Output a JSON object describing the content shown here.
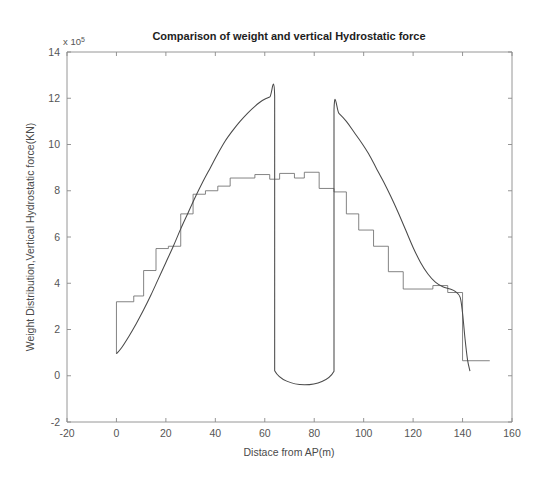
{
  "figure": {
    "title": "Comparison of weight and vertical Hydrostatic force",
    "exponent_prefix": "x 10",
    "exponent_power": "5"
  },
  "axes": {
    "xlabel": "Distace from AP(m)",
    "ylabel": "Weight Distribution,Vertical Hydrostatic force(KN)",
    "xticks": [
      "-20",
      "0",
      "20",
      "40",
      "60",
      "80",
      "100",
      "120",
      "140",
      "160"
    ],
    "yticks": [
      "-2",
      "0",
      "2",
      "4",
      "6",
      "8",
      "10",
      "12",
      "14"
    ]
  },
  "chart_data": {
    "type": "line",
    "title": "Comparison of weight and vertical Hydrostatic force",
    "xlabel": "Distace from AP(m)",
    "ylabel": "Weight Distribution,Vertical Hydrostatic force(KN)",
    "y_scale_exponent": 5,
    "y_scale_note": "values are in units of 1e5 KN",
    "xlim": [
      -20,
      160
    ],
    "ylim": [
      -2,
      14
    ],
    "xtick_step": 20,
    "ytick_step": 2,
    "grid": false,
    "legend": null,
    "series": [
      {
        "name": "Weight Distribution",
        "style": "stepped",
        "points": [
          [
            0,
            0.95
          ],
          [
            0,
            3.2
          ],
          [
            7,
            3.2
          ],
          [
            7,
            3.45
          ],
          [
            11,
            3.45
          ],
          [
            11,
            4.55
          ],
          [
            16,
            4.55
          ],
          [
            16,
            5.5
          ],
          [
            21,
            5.5
          ],
          [
            21,
            5.6
          ],
          [
            26,
            5.6
          ],
          [
            26,
            7.0
          ],
          [
            31,
            7.0
          ],
          [
            31,
            7.85
          ],
          [
            36,
            7.85
          ],
          [
            36,
            8.0
          ],
          [
            41,
            8.0
          ],
          [
            41,
            8.2
          ],
          [
            46,
            8.2
          ],
          [
            46,
            8.55
          ],
          [
            56,
            8.55
          ],
          [
            56,
            8.7
          ],
          [
            62,
            8.7
          ],
          [
            62,
            8.5
          ],
          [
            66,
            8.5
          ],
          [
            66,
            8.75
          ],
          [
            72,
            8.75
          ],
          [
            72,
            8.55
          ],
          [
            76,
            8.55
          ],
          [
            76,
            8.8
          ],
          [
            82,
            8.8
          ],
          [
            82,
            8.1
          ],
          [
            88,
            8.1
          ],
          [
            88,
            7.95
          ],
          [
            93,
            7.95
          ],
          [
            93,
            7.0
          ],
          [
            98,
            7.0
          ],
          [
            98,
            6.3
          ],
          [
            104,
            6.3
          ],
          [
            104,
            5.6
          ],
          [
            110,
            5.6
          ],
          [
            110,
            4.5
          ],
          [
            116,
            4.5
          ],
          [
            116,
            3.75
          ],
          [
            128,
            3.75
          ],
          [
            128,
            3.9
          ],
          [
            134,
            3.9
          ],
          [
            134,
            3.6
          ],
          [
            140,
            3.6
          ],
          [
            140,
            0.65
          ],
          [
            151,
            0.65
          ]
        ]
      },
      {
        "name": "Vertical Hydrostatic force",
        "style": "smooth",
        "points": [
          [
            0,
            0.95
          ],
          [
            2,
            1.2
          ],
          [
            5,
            1.7
          ],
          [
            8,
            2.25
          ],
          [
            11,
            2.85
          ],
          [
            14,
            3.5
          ],
          [
            17,
            4.2
          ],
          [
            20,
            4.9
          ],
          [
            23,
            5.6
          ],
          [
            26,
            6.35
          ],
          [
            29,
            7.05
          ],
          [
            32,
            7.75
          ],
          [
            35,
            8.4
          ],
          [
            38,
            9.0
          ],
          [
            41,
            9.6
          ],
          [
            44,
            10.15
          ],
          [
            47,
            10.6
          ],
          [
            50,
            11.0
          ],
          [
            53,
            11.35
          ],
          [
            56,
            11.65
          ],
          [
            59,
            11.9
          ],
          [
            62,
            12.05
          ],
          [
            64,
            12.1
          ],
          [
            64,
            5.0
          ],
          [
            64,
            0.22
          ],
          [
            88,
            0.2
          ],
          [
            88,
            5.0
          ],
          [
            88,
            11.5
          ],
          [
            90,
            11.35
          ],
          [
            93,
            11.0
          ],
          [
            96,
            10.55
          ],
          [
            99,
            10.1
          ],
          [
            102,
            9.6
          ],
          [
            105,
            9.0
          ],
          [
            108,
            8.4
          ],
          [
            111,
            7.75
          ],
          [
            114,
            7.05
          ],
          [
            117,
            6.3
          ],
          [
            120,
            5.55
          ],
          [
            123,
            4.9
          ],
          [
            126,
            4.4
          ],
          [
            129,
            4.05
          ],
          [
            132,
            3.85
          ],
          [
            135,
            3.75
          ],
          [
            137,
            3.65
          ],
          [
            139,
            3.4
          ],
          [
            140,
            2.7
          ],
          [
            141,
            1.6
          ],
          [
            142,
            0.7
          ],
          [
            143,
            0.2
          ]
        ]
      }
    ]
  },
  "colors": {
    "weight_line": "#6e6e6e",
    "hydro_line": "#4a4a4a",
    "axis": "#8a8a8a",
    "background": "#ffffff"
  }
}
